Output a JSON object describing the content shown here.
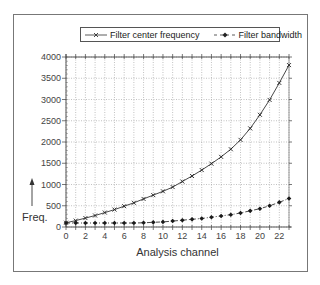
{
  "chart_data": {
    "type": "line",
    "title": "",
    "xlabel": "Analysis channel",
    "ylabel": "Freq.",
    "xlim": [
      0,
      23
    ],
    "ylim": [
      0,
      4000
    ],
    "grid": true,
    "legend_position": "top",
    "x": [
      0,
      1,
      2,
      3,
      4,
      5,
      6,
      7,
      8,
      9,
      10,
      11,
      12,
      13,
      14,
      15,
      16,
      17,
      18,
      19,
      20,
      21,
      22,
      23
    ],
    "x_tick_labels": [
      "0",
      "2",
      "4",
      "6",
      "8",
      "10",
      "12",
      "14",
      "16",
      "18",
      "20",
      "22"
    ],
    "y_tick_labels": [
      "0",
      "500",
      "1000",
      "1500",
      "2000",
      "2500",
      "3000",
      "3500",
      "4000"
    ],
    "series": [
      {
        "name": "Filter center frequency",
        "style": "solid line, x markers",
        "values": [
          100,
          150,
          210,
          270,
          340,
          410,
          490,
          570,
          660,
          750,
          840,
          940,
          1070,
          1200,
          1340,
          1490,
          1650,
          1830,
          2050,
          2320,
          2640,
          2990,
          3390,
          3810
        ]
      },
      {
        "name": "Filter bandwidth",
        "style": "dash-dot line, filled diamond markers",
        "values": [
          95,
          95,
          95,
          95,
          95,
          95,
          95,
          95,
          100,
          110,
          120,
          140,
          160,
          180,
          200,
          230,
          260,
          290,
          330,
          380,
          430,
          500,
          580,
          670
        ]
      }
    ]
  },
  "legend": {
    "center_label": "Filter center frequency",
    "bandwidth_label": "Filter bandwidth"
  },
  "axes": {
    "xlabel": "Analysis channel",
    "ylabel": "Freq."
  }
}
